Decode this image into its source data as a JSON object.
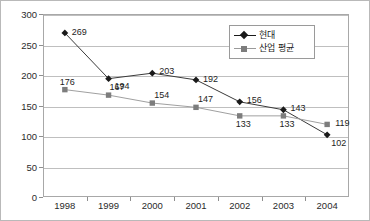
{
  "chart_data": {
    "type": "line",
    "title": "",
    "xlabel": "",
    "ylabel": "",
    "categories": [
      "1998",
      "1999",
      "2000",
      "2001",
      "2002",
      "2003",
      "2004"
    ],
    "ylim": [
      0,
      300
    ],
    "yticks": [
      "0",
      "50",
      "100",
      "150",
      "200",
      "250",
      "300"
    ],
    "ytick_step": 50,
    "grid": "horizontal",
    "legend_position": "top-right",
    "series": [
      {
        "name": "현대",
        "marker": "diamond",
        "color": "#1a1a1a",
        "values": [
          269,
          194,
          203,
          192,
          156,
          143,
          102
        ],
        "labels": [
          "269",
          "194",
          "203",
          "192",
          "156",
          "143",
          "102"
        ]
      },
      {
        "name": "산업 평균",
        "marker": "square",
        "color": "#7d7d7d",
        "values": [
          176,
          167,
          154,
          147,
          133,
          133,
          119
        ],
        "labels": [
          "176",
          "167",
          "154",
          "147",
          "133",
          "133",
          "119"
        ]
      }
    ]
  },
  "legend": {
    "items": [
      {
        "label": "현대"
      },
      {
        "label": "산업 평균"
      }
    ]
  },
  "colors": {
    "series_1": "#1a1a1a",
    "series_2": "#7d7d7d",
    "gridline": "#bfbfbf",
    "axis": "#a8a8a8",
    "frame": "#b9b9b9",
    "text": "#1d1d1d"
  }
}
